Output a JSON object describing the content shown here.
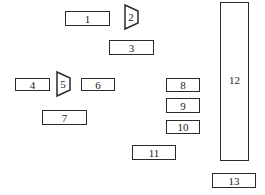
{
  "diagram": {
    "boxes": [
      {
        "id": "1",
        "label": "1",
        "x": 65,
        "y": 11,
        "w": 45,
        "h": 15
      },
      {
        "id": "3",
        "label": "3",
        "x": 109,
        "y": 40,
        "w": 45,
        "h": 15
      },
      {
        "id": "4",
        "label": "4",
        "x": 15,
        "y": 78,
        "w": 35,
        "h": 13
      },
      {
        "id": "6",
        "label": "6",
        "x": 81,
        "y": 78,
        "w": 34,
        "h": 13
      },
      {
        "id": "7",
        "label": "7",
        "x": 42,
        "y": 110,
        "w": 45,
        "h": 15
      },
      {
        "id": "8",
        "label": "8",
        "x": 166,
        "y": 78,
        "w": 34,
        "h": 14
      },
      {
        "id": "9",
        "label": "9",
        "x": 166,
        "y": 98,
        "w": 34,
        "h": 15
      },
      {
        "id": "10",
        "label": "10",
        "x": 166,
        "y": 120,
        "w": 34,
        "h": 14
      },
      {
        "id": "11",
        "label": "11",
        "x": 132,
        "y": 145,
        "w": 44,
        "h": 15
      },
      {
        "id": "12",
        "label": "12",
        "x": 220,
        "y": 2,
        "w": 29,
        "h": 159
      },
      {
        "id": "13",
        "label": "13",
        "x": 212,
        "y": 173,
        "w": 44,
        "h": 15
      }
    ],
    "trapezoids": [
      {
        "id": "2",
        "label": "2"
      },
      {
        "id": "5",
        "label": "5"
      }
    ]
  }
}
